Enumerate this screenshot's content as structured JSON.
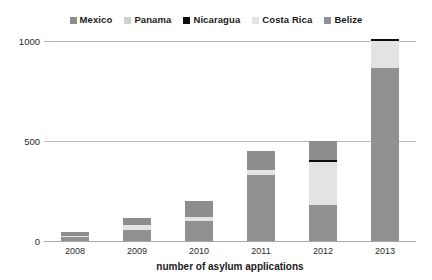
{
  "chart_data": {
    "type": "bar",
    "stacked": true,
    "title": "",
    "xlabel": "number of asylum applications",
    "ylabel": "",
    "categories": [
      "2008",
      "2009",
      "2010",
      "2011",
      "2012",
      "2013"
    ],
    "ylim": [
      0,
      1000
    ],
    "yticks": [
      0,
      500,
      1000
    ],
    "ytick_labels": [
      "0",
      "500",
      "1000"
    ],
    "grid": true,
    "legend_position": "top-center",
    "series": [
      {
        "name": "Belize",
        "color": "#919191",
        "values": [
          20,
          55,
          100,
          330,
          180,
          865
        ]
      },
      {
        "name": "Costa Rica",
        "color": "#e3e3e3",
        "values": [
          5,
          25,
          20,
          25,
          215,
          135
        ]
      },
      {
        "name": "Nicaragua",
        "color": "#0d0d0d",
        "values": [
          0,
          0,
          0,
          0,
          12,
          12
        ]
      },
      {
        "name": "Panama",
        "color": "#cfcfcf",
        "values": [
          0,
          0,
          0,
          0,
          0,
          0
        ]
      },
      {
        "name": "Mexico",
        "color": "#8d8d8d",
        "values": [
          20,
          35,
          80,
          95,
          95,
          0
        ]
      }
    ],
    "totals": [
      45,
      115,
      200,
      450,
      450,
      1000
    ]
  },
  "legend": {
    "items": [
      {
        "label": "Mexico",
        "color": "#8d8d8d"
      },
      {
        "label": "Panama",
        "color": "#cfcfcf"
      },
      {
        "label": "Nicaragua",
        "color": "#0d0d0d"
      },
      {
        "label": "Costa Rica",
        "color": "#e3e3e3"
      },
      {
        "label": "Belize",
        "color": "#919191"
      }
    ]
  },
  "axes": {
    "y_tick_1000": "1000",
    "y_tick_500": "500",
    "y_tick_0": "0",
    "x_tick_0": "2008",
    "x_tick_1": "2009",
    "x_tick_2": "2010",
    "x_tick_3": "2011",
    "x_tick_4": "2012",
    "x_tick_5": "2013",
    "x_axis_title": "number of asylum applications"
  }
}
